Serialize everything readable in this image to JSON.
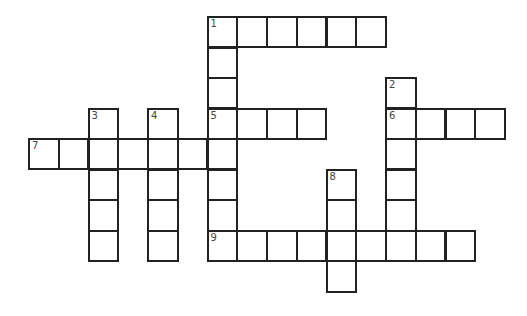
{
  "puzzle": {
    "origin": {
      "x": 29,
      "y": 17
    },
    "cell_w": 29.75,
    "cell_h": 30.55,
    "colors": {
      "border": "#222222",
      "number": "#444444",
      "background": "#ffffff"
    },
    "clues_placed": [
      {
        "number": "1",
        "direction": "across",
        "row": 0,
        "col": 6,
        "length": 6
      },
      {
        "number": "1",
        "direction": "down",
        "row": 0,
        "col": 6,
        "length": 8
      },
      {
        "number": "2",
        "direction": "down",
        "row": 2,
        "col": 12,
        "length": 6
      },
      {
        "number": "3",
        "direction": "down",
        "row": 3,
        "col": 2,
        "length": 5
      },
      {
        "number": "4",
        "direction": "down",
        "row": 3,
        "col": 4,
        "length": 5
      },
      {
        "number": "5",
        "direction": "across",
        "row": 3,
        "col": 6,
        "length": 4
      },
      {
        "number": "6",
        "direction": "across",
        "row": 3,
        "col": 12,
        "length": 4
      },
      {
        "number": "7",
        "direction": "across",
        "row": 4,
        "col": 0,
        "length": 7
      },
      {
        "number": "8",
        "direction": "down",
        "row": 5,
        "col": 10,
        "length": 4
      },
      {
        "number": "9",
        "direction": "across",
        "row": 7,
        "col": 6,
        "length": 9
      }
    ]
  }
}
